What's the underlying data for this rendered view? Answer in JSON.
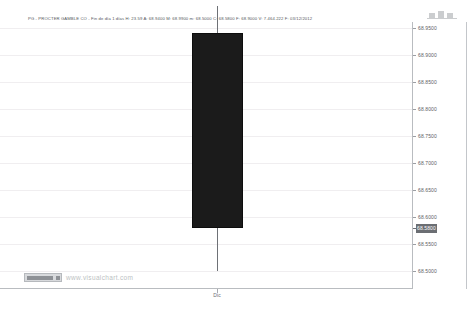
{
  "header": {
    "info_line": "PG - PROCTER  GAMBLE CO - Fin de día 1 días  H: 23.59  A: 68.9400  M: 68.9900  m: 68.5000  C: 68.5800  F:  68.9000  V: 7.464.222  F: 03/12/2012",
    "symbol": "PG",
    "name": "PROCTER  GAMBLE CO",
    "interval": "Fin de día 1 días",
    "fields": [
      {
        "key": "H",
        "value": "23.59"
      },
      {
        "key": "A",
        "value": "68.9400"
      },
      {
        "key": "M",
        "value": "68.9900"
      },
      {
        "key": "m",
        "value": "68.5000"
      },
      {
        "key": "C",
        "value": "68.5800"
      },
      {
        "key": "F",
        "value": "68.9000"
      },
      {
        "key": "V",
        "value": "7.464.222"
      },
      {
        "key": "F",
        "value": "03/12/2012"
      }
    ]
  },
  "watermark": {
    "url": "www.visualchart.com",
    "logo_name": "visualchart-logo"
  },
  "price_axis": {
    "current_price": "68.5800",
    "labels": [
      "68.9500",
      "68.9000",
      "68.8500",
      "68.8000",
      "68.7500",
      "68.7000",
      "68.6500",
      "68.6000",
      "68.5500",
      "68.5000"
    ]
  },
  "time_axis": {
    "labels": [
      "Dic"
    ]
  },
  "chart_data": {
    "type": "candlestick",
    "title": "PG - PROCTER  GAMBLE CO",
    "xlabel": "",
    "ylabel": "",
    "ylim": [
      68.5,
      68.95
    ],
    "grid": true,
    "legend": "none",
    "categories": [
      "Dic"
    ],
    "yticks": [
      68.95,
      68.9,
      68.85,
      68.8,
      68.75,
      68.7,
      68.65,
      68.6,
      68.55,
      68.5
    ],
    "series": [
      {
        "name": "PG",
        "candles": [
          {
            "label": "Dic",
            "open": 68.94,
            "high": 68.99,
            "low": 68.5,
            "close": 68.58,
            "volume": "7.464.222",
            "date": "03/12/2012",
            "direction": "down",
            "color": "#1b1b1b"
          }
        ]
      }
    ],
    "annotations": [
      {
        "name": "current-price-marker",
        "value": "68.5800"
      }
    ]
  },
  "colors": {
    "candle_down": "#1b1b1b",
    "wick": "#6e7176",
    "grid": "#f0eef0",
    "axis": "#b9bcc0",
    "text": "#5d6064",
    "current_badge_bg": "#6b6e73",
    "watermark_text": "#bcbfc3"
  }
}
